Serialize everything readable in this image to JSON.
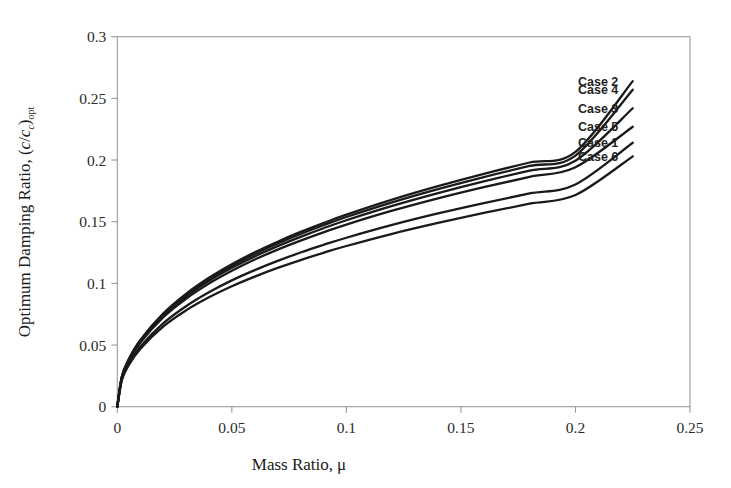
{
  "figure": {
    "background": "#ffffff",
    "plot_frame_color": "#9a9a9a",
    "curve_color": "#1a1a1a"
  },
  "axes": {
    "x": {
      "label_main": "Mass Ratio,",
      "label_symbol": "μ",
      "ticks": [
        "0",
        "0.05",
        "0.1",
        "0.15",
        "0.2",
        "0.25"
      ],
      "tick_values": [
        0,
        0.05,
        0.1,
        0.15,
        0.2,
        0.25
      ],
      "range": [
        0,
        0.25
      ]
    },
    "y": {
      "label_main": "Optimum Damping Ratio, (",
      "label_num": "c",
      "label_slash": "/",
      "label_den": "c",
      "label_den_sub": "c",
      "label_close": ")",
      "label_sub": "opt",
      "ticks": [
        "0",
        "0.05",
        "0.1",
        "0.15",
        "0.2",
        "0.25",
        "0.3"
      ],
      "tick_values": [
        0,
        0.05,
        0.1,
        0.15,
        0.2,
        0.25,
        0.3
      ],
      "range": [
        0,
        0.3
      ]
    }
  },
  "legend": {
    "position": "right-inside",
    "items": [
      {
        "label": "Case 2",
        "y_at_end": 0.264
      },
      {
        "label": "Case 4",
        "y_at_end": 0.257
      },
      {
        "label": "Case 3",
        "y_at_end": 0.242
      },
      {
        "label": "Case 5",
        "y_at_end": 0.227
      },
      {
        "label": "Case 1",
        "y_at_end": 0.214
      },
      {
        "label": "Case 6",
        "y_at_end": 0.203
      }
    ]
  },
  "chart_data": {
    "type": "line",
    "title": "",
    "xlabel": "Mass Ratio, μ",
    "ylabel": "Optimum Damping Ratio, (c/c_c)_opt",
    "xlim": [
      0,
      0.25
    ],
    "ylim": [
      0,
      0.3
    ],
    "grid": false,
    "legend_position": "right-inside",
    "x": [
      0,
      0.002,
      0.005,
      0.01,
      0.02,
      0.03,
      0.04,
      0.05,
      0.06,
      0.07,
      0.08,
      0.09,
      0.1,
      0.12,
      0.14,
      0.16,
      0.18,
      0.2,
      0.225
    ],
    "series": [
      {
        "name": "Case 2",
        "values": [
          0,
          0.0245,
          0.0385,
          0.054,
          0.0755,
          0.0915,
          0.1045,
          0.1155,
          0.1252,
          0.1338,
          0.1417,
          0.1489,
          0.1557,
          0.1679,
          0.1788,
          0.1888,
          0.198,
          0.2066,
          0.264
        ]
      },
      {
        "name": "Case 4",
        "values": [
          0,
          0.0243,
          0.0382,
          0.0535,
          0.0748,
          0.0906,
          0.1034,
          0.1143,
          0.1238,
          0.1323,
          0.14,
          0.1471,
          0.1538,
          0.1657,
          0.1764,
          0.1862,
          0.1952,
          0.2036,
          0.257
        ]
      },
      {
        "name": "Case 3",
        "values": [
          0,
          0.024,
          0.0377,
          0.0528,
          0.0738,
          0.0893,
          0.1019,
          0.1126,
          0.1219,
          0.1302,
          0.1377,
          0.1447,
          0.1512,
          0.1628,
          0.1732,
          0.1827,
          0.1914,
          0.1995,
          0.242
        ]
      },
      {
        "name": "Case 5",
        "values": [
          0,
          0.0236,
          0.0371,
          0.0519,
          0.0724,
          0.0875,
          0.0998,
          0.1102,
          0.1193,
          0.1274,
          0.1347,
          0.1414,
          0.1477,
          0.1589,
          0.1689,
          0.178,
          0.1864,
          0.1942,
          0.227
        ]
      },
      {
        "name": "Case 1",
        "values": [
          0,
          0.0222,
          0.0348,
          0.0486,
          0.0676,
          0.0815,
          0.0928,
          0.1024,
          0.1107,
          0.1182,
          0.125,
          0.1312,
          0.137,
          0.1474,
          0.1567,
          0.1651,
          0.1729,
          0.1802,
          0.214
        ]
      },
      {
        "name": "Case 6",
        "values": [
          0,
          0.0215,
          0.0337,
          0.0469,
          0.065,
          0.0781,
          0.0887,
          0.0977,
          0.1055,
          0.1125,
          0.1189,
          0.1248,
          0.1303,
          0.1402,
          0.149,
          0.1571,
          0.1646,
          0.1716,
          0.203
        ]
      }
    ]
  }
}
